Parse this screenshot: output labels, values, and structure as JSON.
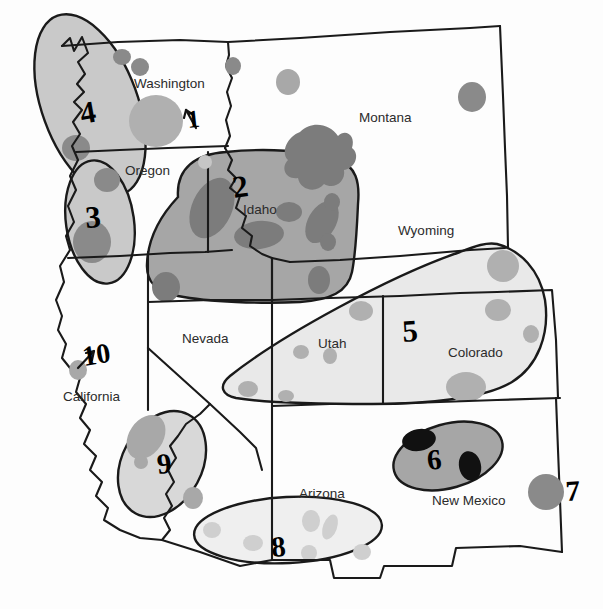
{
  "map": {
    "title": "Western United States Resource Region Map",
    "background_color": "#fdfdfd",
    "border_color": "#1a1a1a",
    "colors": {
      "region_fill_light": "#e9e9e9",
      "region_fill_medium": "#c9c9c9",
      "region_fill_dark": "#a6a6a6",
      "blob_light": "#d4d4d4",
      "blob_medium": "#b0b0b0",
      "blob_dark": "#8a8a8a",
      "blob_darkest": "#6f6f6f",
      "blob_black": "#111111",
      "outline": "#1a1a1a",
      "label_text": "#2b2b2b"
    },
    "state_labels": [
      {
        "name": "Washington",
        "text": "Washington",
        "x": 134,
        "y": 88
      },
      {
        "name": "Oregon",
        "text": "Oregon",
        "x": 125,
        "y": 170
      },
      {
        "name": "Idaho",
        "text": "Idaho",
        "x": 243,
        "y": 209
      },
      {
        "name": "Montana",
        "text": "Montana",
        "x": 359,
        "y": 117
      },
      {
        "name": "Wyoming",
        "text": "Wyoming",
        "x": 398,
        "y": 230
      },
      {
        "name": "Nevada",
        "text": "Nevada",
        "x": 182,
        "y": 338
      },
      {
        "name": "Utah",
        "text": "Utah",
        "x": 318,
        "y": 343
      },
      {
        "name": "Colorado",
        "text": "Colorado",
        "x": 448,
        "y": 352
      },
      {
        "name": "California",
        "text": "California",
        "x": 63,
        "y": 396
      },
      {
        "name": "Arizona",
        "text": "Arizona",
        "x": 299,
        "y": 493
      },
      {
        "name": "New Mexico",
        "text": "New Mexico",
        "x": 432,
        "y": 500
      }
    ],
    "region_numbers": [
      {
        "id": "1",
        "label": "1",
        "x": 193,
        "y": 118,
        "size": 25,
        "style": "arrow-callout",
        "target": "Washington blob"
      },
      {
        "id": "2",
        "label": "2",
        "x": 244,
        "y": 190,
        "size": 30,
        "style": "inside-region"
      },
      {
        "id": "3",
        "label": "3",
        "x": 97,
        "y": 216,
        "size": 30,
        "style": "inside-region"
      },
      {
        "id": "4",
        "label": "4",
        "x": 94,
        "y": 113,
        "size": 30,
        "style": "inside-region"
      },
      {
        "id": "5",
        "label": "5",
        "x": 413,
        "y": 330,
        "size": 30,
        "style": "inside-region"
      },
      {
        "id": "6",
        "label": "6",
        "x": 437,
        "y": 459,
        "size": 28,
        "style": "inside-region"
      },
      {
        "id": "7",
        "label": "7",
        "x": 574,
        "y": 490,
        "size": 28,
        "style": "beside-dot"
      },
      {
        "id": "8",
        "label": "8",
        "x": 282,
        "y": 546,
        "size": 28,
        "style": "inside-region"
      },
      {
        "id": "9",
        "label": "9",
        "x": 167,
        "y": 463,
        "size": 28,
        "style": "inside-region"
      },
      {
        "id": "10",
        "label": "10",
        "x": 96,
        "y": 356,
        "size": 27,
        "style": "arrow-callout",
        "target": "California coastal dot"
      }
    ],
    "regions": [
      {
        "id": "region-4",
        "number": "4",
        "state": "Washington",
        "fill": "#c9c9c9",
        "blobs": 3
      },
      {
        "id": "region-3",
        "number": "3",
        "state": "Oregon",
        "fill": "#c9c9c9",
        "blobs": 2
      },
      {
        "id": "region-2",
        "number": "2",
        "state": "Idaho",
        "fill": "#a6a6a6",
        "blobs": 9
      },
      {
        "id": "region-5",
        "number": "5",
        "state": "Utah/Colorado",
        "fill": "#e9e9e9",
        "blobs": 8
      },
      {
        "id": "region-6",
        "number": "6",
        "state": "New Mexico",
        "fill": "#a6a6a6",
        "blobs": 2
      },
      {
        "id": "region-9",
        "number": "9",
        "state": "California",
        "fill": "#d8d8d8",
        "blobs": 3
      },
      {
        "id": "region-8",
        "number": "8",
        "state": "Arizona",
        "fill": "#efefef",
        "blobs": 6
      }
    ],
    "isolated_markers": [
      {
        "id": "marker-1",
        "label": "Washington central blob",
        "x": 156,
        "y": 122,
        "r": 27,
        "fill": "#b0b0b0"
      },
      {
        "id": "marker-7",
        "label": "7",
        "x": 546,
        "y": 492,
        "r": 18,
        "fill": "#8a8a8a"
      },
      {
        "id": "marker-10",
        "label": "10",
        "x": 78,
        "y": 371,
        "r": 9,
        "fill": "#a8a8a8"
      },
      {
        "id": "marker-montana-a",
        "label": "Montana north blob",
        "x": 288,
        "y": 82,
        "r": 12,
        "fill": "#a8a8a8"
      },
      {
        "id": "marker-montana-b",
        "label": "Montana east blob",
        "x": 472,
        "y": 98,
        "r": 14,
        "fill": "#8a8a8a"
      },
      {
        "id": "marker-yellowstone",
        "label": "Yellowstone blob",
        "x": 320,
        "y": 150,
        "r": 30,
        "fill": "#7c7c7c"
      },
      {
        "id": "marker-idaho-panhandle",
        "label": "Idaho panhandle blob",
        "x": 234,
        "y": 68,
        "r": 8,
        "fill": "#8a8a8a"
      },
      {
        "id": "marker-oregon-east",
        "label": "Oregon east blob",
        "x": 205,
        "y": 165,
        "r": 6,
        "fill": "#c2c2c2"
      }
    ],
    "legend_note": ""
  }
}
